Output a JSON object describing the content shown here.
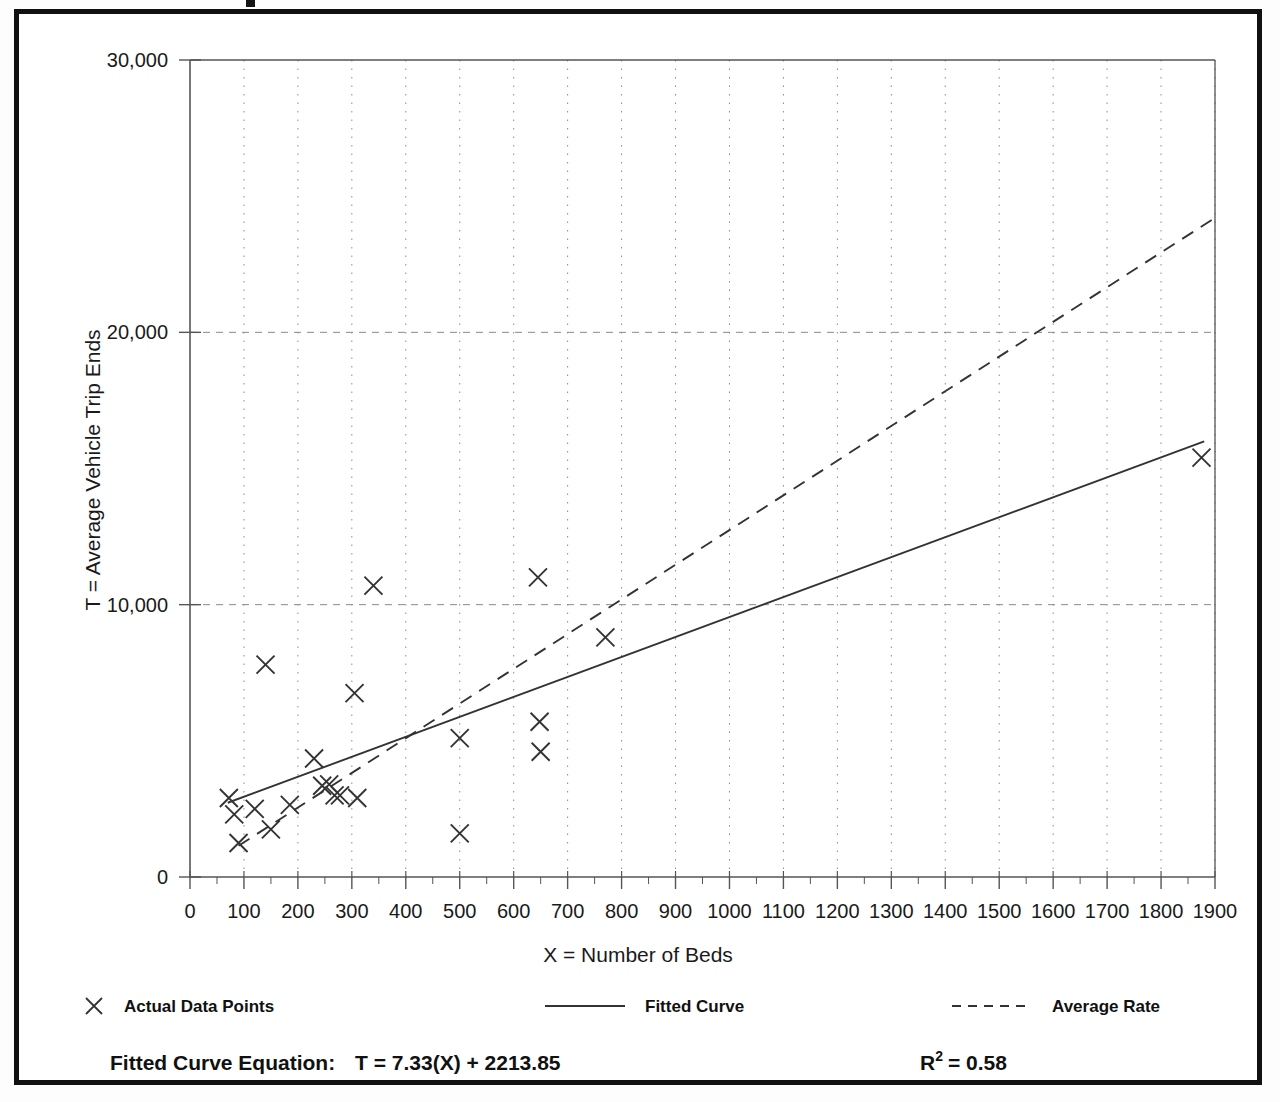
{
  "frame": {
    "border_color": "#111111",
    "background": "#ffffff"
  },
  "axis": {
    "y_title": "T = Average Vehicle Trip Ends",
    "x_title": "X = Number of Beds",
    "y_ticks": [
      "0",
      "10,000",
      "20,000",
      "30,000"
    ],
    "x_ticks": [
      "0",
      "100",
      "200",
      "300",
      "400",
      "500",
      "600",
      "700",
      "800",
      "900",
      "1000",
      "1100",
      "1200",
      "1300",
      "1400",
      "1500",
      "1600",
      "1700",
      "1800",
      "1900"
    ]
  },
  "legend": {
    "items": [
      {
        "label": "Actual Data Points",
        "marker": "cross-marker"
      },
      {
        "label": "Fitted Curve",
        "marker": "solid-line-marker"
      },
      {
        "label": "Average Rate",
        "marker": "dashed-line-marker"
      }
    ]
  },
  "footer": {
    "equation_label": "Fitted Curve Equation:",
    "equation_value": "T = 7.33(X) + 2213.85",
    "r2_base": "R",
    "r2_exponent": "2",
    "r2_value": "= 0.58"
  },
  "chart_data": {
    "type": "scatter",
    "title": "",
    "xlabel": "X = Number of Beds",
    "ylabel": "T = Average Vehicle Trip Ends",
    "xlim": [
      0,
      1900
    ],
    "ylim": [
      0,
      30000
    ],
    "x_major_step": 100,
    "x_minor_step": 50,
    "y_major_step": 10000,
    "grid": true,
    "grid_style": "dotted-vertical-dashed-horizontal",
    "legend_position": "below-axis",
    "series": [
      {
        "name": "Actual Data Points",
        "type": "scatter",
        "marker": "x",
        "color": "#333333",
        "points": [
          [
            72,
            2900
          ],
          [
            82,
            2300
          ],
          [
            90,
            1250
          ],
          [
            120,
            2500
          ],
          [
            140,
            7800
          ],
          [
            150,
            1750
          ],
          [
            185,
            2650
          ],
          [
            230,
            4350
          ],
          [
            245,
            3350
          ],
          [
            258,
            3400
          ],
          [
            268,
            3000
          ],
          [
            278,
            3000
          ],
          [
            305,
            6750
          ],
          [
            310,
            2900
          ],
          [
            340,
            10700
          ],
          [
            500,
            5100
          ],
          [
            500,
            1600
          ],
          [
            645,
            11000
          ],
          [
            648,
            5700
          ],
          [
            650,
            4600
          ],
          [
            770,
            8800
          ],
          [
            1875,
            15400
          ]
        ]
      },
      {
        "name": "Fitted Curve",
        "type": "line",
        "style": "solid",
        "color": "#333333",
        "equation": "T = 7.33(X) + 2213.85",
        "slope": 7.33,
        "intercept": 2213.85,
        "r_squared": 0.58,
        "x_from": 70,
        "x_to": 1880
      },
      {
        "name": "Average Rate",
        "type": "line",
        "style": "dashed",
        "color": "#333333",
        "slope": 12.74,
        "intercept": 0,
        "x_from": 90,
        "x_to": 1900
      }
    ]
  }
}
